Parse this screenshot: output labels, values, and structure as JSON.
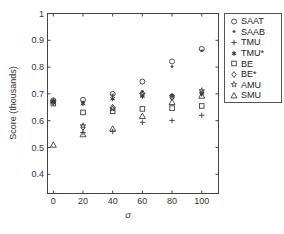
{
  "figure": {
    "background": "#ffffff",
    "axis_color": "#444444",
    "marker_color": "#3c3c3c",
    "text_color": "#333333",
    "legend_border_color": "#555555"
  },
  "chart_data": {
    "type": "scatter",
    "title": "",
    "xlabel": "σ",
    "ylabel": "Score (thousands)",
    "xlim": [
      -4,
      110
    ],
    "ylim": [
      0.33,
      1.0
    ],
    "x_ticks": [
      0,
      20,
      40,
      60,
      80,
      100
    ],
    "x_tick_labels": [
      "0",
      "20",
      "40",
      "60",
      "80",
      "100"
    ],
    "y_ticks": [
      0.4,
      0.5,
      0.6,
      0.7,
      0.8,
      0.9,
      1
    ],
    "y_tick_labels": [
      "0.4",
      "0.5",
      "0.6",
      "0.7",
      "0.8",
      "0.9",
      "1"
    ],
    "grid": false,
    "legend_position": "outside-right",
    "x": [
      0,
      20,
      40,
      60,
      80,
      100
    ],
    "series": [
      {
        "name": "SAAT",
        "marker": "circle",
        "values": [
          0.676,
          0.678,
          0.7,
          0.746,
          0.821,
          0.868
        ]
      },
      {
        "name": "SAAB",
        "marker": "dot-star",
        "values": [
          0.671,
          0.67,
          0.696,
          0.709,
          0.802,
          0.861
        ]
      },
      {
        "name": "TMU",
        "marker": "plus",
        "values": [
          0.667,
          0.556,
          0.56,
          0.594,
          0.601,
          0.62
        ]
      },
      {
        "name": "TMU*",
        "marker": "filled-star",
        "values": [
          0.674,
          0.664,
          0.682,
          0.691,
          0.694,
          0.7
        ]
      },
      {
        "name": "BE",
        "marker": "square",
        "values": [
          0.664,
          0.631,
          0.635,
          0.644,
          0.647,
          0.655
        ]
      },
      {
        "name": "BE*",
        "marker": "diamond",
        "values": [
          0.669,
          0.576,
          0.65,
          0.703,
          0.687,
          0.705
        ]
      },
      {
        "name": "AMU",
        "marker": "pentagram",
        "values": [
          0.672,
          0.581,
          0.645,
          0.698,
          0.69,
          0.712
        ]
      },
      {
        "name": "SMU",
        "marker": "triangle",
        "values": [
          0.51,
          0.549,
          0.57,
          0.617,
          0.669,
          0.693
        ]
      }
    ]
  }
}
